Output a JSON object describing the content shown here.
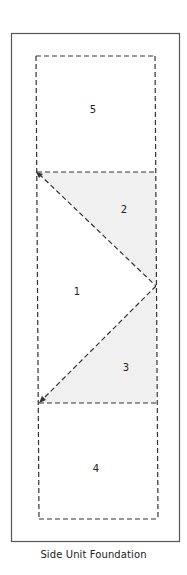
{
  "caption": "Side Unit Foundation",
  "colors": {
    "outline": "#555555",
    "dash": "#333333",
    "shade": "#f0f0f0",
    "background": "#ffffff",
    "text": "#222222"
  },
  "outer_border": {
    "x": 11,
    "y": 33,
    "width": 169,
    "height": 509
  },
  "pieces": [
    {
      "id": "1",
      "label": "1",
      "shaded": false,
      "label_pos": [
        77,
        292
      ]
    },
    {
      "id": "2",
      "label": "2",
      "shaded": true,
      "label_pos": [
        124,
        210
      ]
    },
    {
      "id": "3",
      "label": "3",
      "shaded": true,
      "label_pos": [
        126,
        368
      ]
    },
    {
      "id": "4",
      "label": "4",
      "shaded": false,
      "label_pos": [
        96,
        469
      ]
    },
    {
      "id": "5",
      "label": "5",
      "shaded": false,
      "label_pos": [
        93,
        110
      ]
    }
  ],
  "piecing_arrows": [
    {
      "name": "arrow-to-top-left-vertex",
      "at": [
        36,
        172
      ]
    },
    {
      "name": "arrow-to-bottom-left-vertex",
      "at": [
        39,
        403
      ]
    }
  ]
}
